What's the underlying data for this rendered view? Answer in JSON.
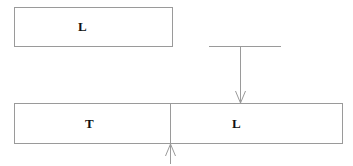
{
  "diagram": {
    "top_box": {
      "label": "L"
    },
    "bottom_box": {
      "left_cell": {
        "label": "T"
      },
      "right_cell": {
        "label": "L"
      }
    },
    "connectors": [
      {
        "type": "t-bar-arrow",
        "direction": "down",
        "from": "horizontal-bar",
        "to": "bottom_box.right_cell"
      },
      {
        "type": "arrow",
        "direction": "up",
        "from": "below",
        "to": "bottom_box.divider"
      }
    ],
    "colors": {
      "line": "#9a9a9a",
      "text": "#111111",
      "background": "#ffffff"
    }
  }
}
